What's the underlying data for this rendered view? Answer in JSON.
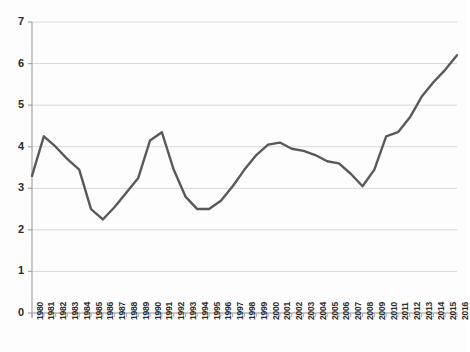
{
  "chart_data": {
    "type": "line",
    "title": "",
    "subtitle": "",
    "xlabel": "",
    "ylabel": "",
    "grid": true,
    "legend": false,
    "legend_position": "none",
    "line_color": "#595959",
    "gridline_color": "#d9d9d9",
    "axis_color": "#a6a6a6",
    "ylim": [
      0,
      7
    ],
    "y_ticks": [
      "0",
      "1",
      "2",
      "3",
      "4",
      "5",
      "6",
      "7"
    ],
    "y_tick_values": [
      0,
      1,
      2,
      3,
      4,
      5,
      6,
      7
    ],
    "categories": [
      "1980",
      "1981",
      "1982",
      "1983",
      "1984",
      "1985",
      "1986",
      "1987",
      "1988",
      "1989",
      "1990",
      "1991",
      "1992",
      "1993",
      "1994",
      "1995",
      "1996",
      "1997",
      "1998",
      "1999",
      "2000",
      "2001",
      "2002",
      "2003",
      "2004",
      "2005",
      "2006",
      "2007",
      "2008",
      "2009",
      "2010",
      "2011",
      "2012",
      "2013",
      "2014",
      "2015",
      "2016"
    ],
    "values": [
      3.3,
      4.25,
      4.0,
      3.7,
      3.45,
      2.5,
      2.25,
      2.55,
      2.9,
      3.25,
      4.15,
      4.35,
      3.45,
      2.8,
      2.5,
      2.5,
      2.7,
      3.05,
      3.45,
      3.8,
      4.05,
      4.1,
      3.95,
      3.9,
      3.8,
      3.65,
      3.6,
      3.35,
      3.05,
      3.45,
      4.25,
      4.35,
      4.7,
      5.2,
      5.55,
      5.85,
      6.2
    ]
  }
}
